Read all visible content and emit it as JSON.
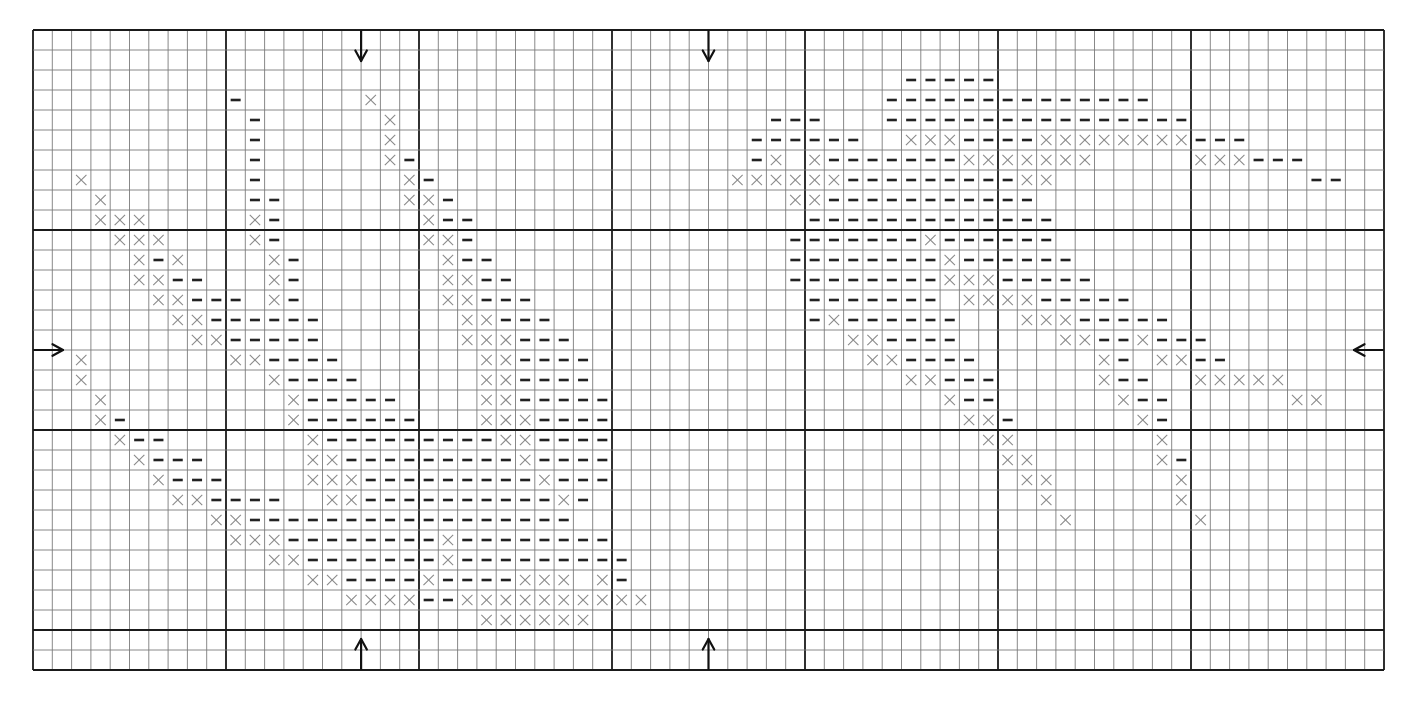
{
  "pattern": {
    "title": "Cross-stitch chart",
    "columns": 70,
    "rows": 32,
    "major_every": 10,
    "symbols": {
      "x": {
        "name": "cross-stitch",
        "glyph": "×",
        "color": "#8a8a8a"
      },
      "-": {
        "name": "backstitch-dash",
        "glyph": "–",
        "color": "#222222"
      }
    },
    "center_markers": {
      "top_columns": [
        17,
        35
      ],
      "bottom_columns": [
        17,
        35
      ],
      "left_row": 16,
      "right_row": 16
    },
    "stitches": [
      [],
      [],
      [
        [
          45,
          "-----"
        ]
      ],
      [
        [
          10,
          "-"
        ],
        [
          17,
          "x"
        ],
        [
          44,
          "--------------"
        ]
      ],
      [
        [
          11,
          "-"
        ],
        [
          18,
          "x"
        ],
        [
          38,
          "---"
        ],
        [
          44,
          "----------------"
        ]
      ],
      [
        [
          11,
          "-"
        ],
        [
          18,
          "x"
        ],
        [
          37,
          "------"
        ],
        [
          45,
          "xxx----xxxxxxxx---"
        ]
      ],
      [
        [
          11,
          "-"
        ],
        [
          18,
          "x-"
        ],
        [
          37,
          "-x.x-------xxxxxxx"
        ],
        [
          60,
          "xxx---"
        ]
      ],
      [
        [
          2,
          "x"
        ],
        [
          11,
          "-"
        ],
        [
          19,
          "x-"
        ],
        [
          36,
          "xxxxxx---------xx"
        ],
        [
          66,
          "--"
        ]
      ],
      [
        [
          3,
          "x"
        ],
        [
          11,
          "--"
        ],
        [
          19,
          "xx-"
        ],
        [
          39,
          "xx-----------"
        ]
      ],
      [
        [
          3,
          "xxx"
        ],
        [
          11,
          "x-"
        ],
        [
          20,
          "x--"
        ],
        [
          40,
          "-------------"
        ]
      ],
      [
        [
          4,
          "xxx"
        ],
        [
          11,
          "x-"
        ],
        [
          20,
          "xx-"
        ],
        [
          39,
          "-------x------"
        ]
      ],
      [
        [
          5,
          "x-x"
        ],
        [
          12,
          "x-"
        ],
        [
          21,
          "x--"
        ],
        [
          39,
          "--------x------"
        ]
      ],
      [
        [
          5,
          "xx--"
        ],
        [
          12,
          "x-"
        ],
        [
          21,
          "xx--"
        ],
        [
          39,
          "--------xxx-----"
        ]
      ],
      [
        [
          6,
          "xx---"
        ],
        [
          12,
          "x-"
        ],
        [
          21,
          "xx---"
        ],
        [
          40,
          "-------.xxxx-----"
        ]
      ],
      [
        [
          7,
          "xx------"
        ],
        [
          22,
          "xx---"
        ],
        [
          40,
          "-x------...xxx-----"
        ]
      ],
      [
        [
          8,
          "xx-----"
        ],
        [
          22,
          "xxx---"
        ],
        [
          42,
          "xx----.....xx--x---"
        ]
      ],
      [
        [
          2,
          "x"
        ],
        [
          10,
          "xx----"
        ],
        [
          23,
          "xx----"
        ],
        [
          43,
          "xx----......x-.xx--"
        ]
      ],
      [
        [
          2,
          "x"
        ],
        [
          12,
          "x----"
        ],
        [
          23,
          "xx----"
        ],
        [
          45,
          "xx---.....x--..xxxxx"
        ]
      ],
      [
        [
          3,
          "x"
        ],
        [
          13,
          "x-----"
        ],
        [
          23,
          "xx-----"
        ],
        [
          47,
          "x--......x--......xx"
        ]
      ],
      [
        [
          3,
          "x-"
        ],
        [
          13,
          "x------"
        ],
        [
          23,
          "xxx----"
        ],
        [
          48,
          "xx-......x-"
        ]
      ],
      [
        [
          4,
          "x--"
        ],
        [
          14,
          "x---------xx----"
        ],
        [
          49,
          "xx.......x"
        ]
      ],
      [
        [
          5,
          "x---"
        ],
        [
          14,
          "xx---------x----"
        ],
        [
          50,
          "xx......x-"
        ]
      ],
      [
        [
          6,
          "x---"
        ],
        [
          14,
          "xxx---------x---"
        ],
        [
          51,
          "xx......x"
        ]
      ],
      [
        [
          7,
          "xx----"
        ],
        [
          15,
          "xx----------x-"
        ],
        [
          52,
          "x......x"
        ]
      ],
      [
        [
          9,
          "xx-----------------"
        ],
        [
          53,
          "x......x"
        ]
      ],
      [
        [
          10,
          "xxx--------x--------"
        ]
      ],
      [
        [
          12,
          "xx-------x---------"
        ]
      ],
      [
        [
          14,
          "xx----x----xxx.x-"
        ]
      ],
      [
        [
          16,
          "xxxx--xxxxxxxxxx"
        ]
      ],
      [
        [
          23,
          "xxxxxx"
        ]
      ],
      [],
      []
    ]
  }
}
